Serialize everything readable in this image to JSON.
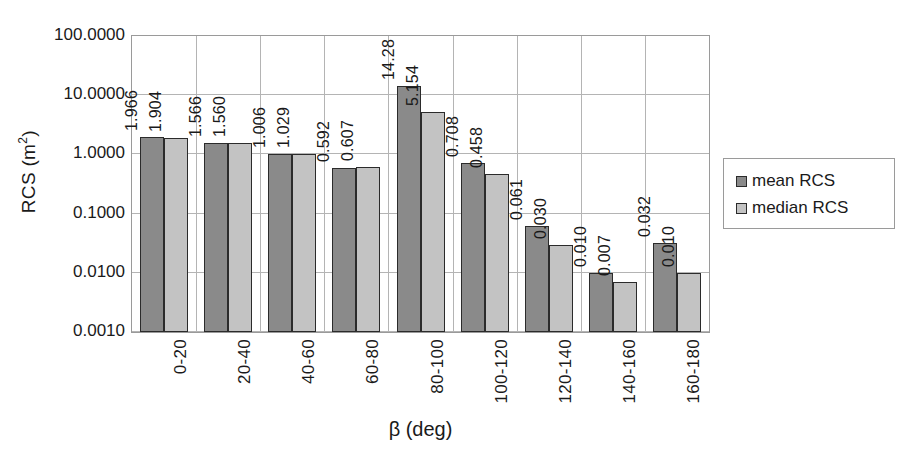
{
  "chart_data": {
    "type": "bar",
    "title": "",
    "xlabel": "β (deg)",
    "ylabel": "RCS (m²)",
    "yscale": "log",
    "ylim": [
      0.001,
      100.0
    ],
    "ytick_labels": [
      "100.0000",
      "10.0000",
      "1.0000",
      "0.1000",
      "0.0100",
      "0.0010"
    ],
    "ytick_values": [
      100.0,
      10.0,
      1.0,
      0.1,
      0.01,
      0.001
    ],
    "grid": "horizontal-and-vertical",
    "legend_position": "right",
    "categories": [
      "0-20",
      "20-40",
      "40-60",
      "60-80",
      "80-100",
      "100-120",
      "120-140",
      "140-160",
      "160-180"
    ],
    "series": [
      {
        "name": "mean RCS",
        "color": "#8a8a8a",
        "values": [
          1.966,
          1.566,
          1.006,
          0.592,
          14.28,
          0.708,
          0.061,
          0.01,
          0.032
        ],
        "labels": [
          "1.966",
          "1.566",
          "1.006",
          "0.592",
          "14.28",
          "0.708",
          "0.061",
          "0.010",
          "0.032"
        ]
      },
      {
        "name": "median RCS",
        "color": "#c3c3c3",
        "values": [
          1.904,
          1.56,
          1.029,
          0.607,
          5.154,
          0.458,
          0.03,
          0.007,
          0.01
        ],
        "labels": [
          "1.904",
          "1.560",
          "1.029",
          "0.607",
          "5.154",
          "0.458",
          "0.030",
          "0.007",
          "0.010"
        ]
      }
    ]
  },
  "axis": {
    "y_title_main": "RCS (m",
    "y_title_sup": "2",
    "y_title_tail": ")",
    "x_title": "β (deg)"
  },
  "legend": {
    "items": [
      {
        "label": "mean RCS"
      },
      {
        "label": "median RCS"
      }
    ]
  }
}
